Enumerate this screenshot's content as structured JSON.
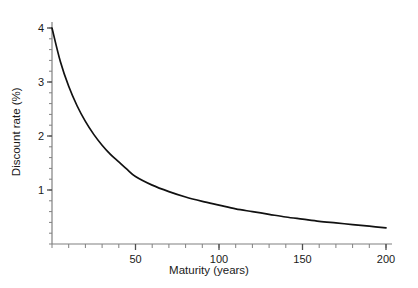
{
  "chart_data": {
    "type": "line",
    "title": "",
    "subtitle": "",
    "xlabel": "Maturity (years)",
    "ylabel": "Discount rate (%)",
    "xlim": [
      0,
      200
    ],
    "ylim": [
      0,
      4
    ],
    "grid": false,
    "legend": null,
    "legend_position": "none",
    "x_major_ticks": [
      50,
      100,
      150,
      200
    ],
    "x_major_tick_labels": [
      "50",
      "100",
      "150",
      "200"
    ],
    "x_minor_tick_step": 10,
    "y_major_ticks": [
      1,
      2,
      3,
      4
    ],
    "y_major_tick_labels": [
      "1",
      "2",
      "3",
      "4"
    ],
    "y_minor_tick_step": 0.2,
    "line_color": "#111111",
    "axis_color": "#808080",
    "series": [
      {
        "name": "Discount rate",
        "x": [
          0,
          5,
          10,
          15,
          20,
          25,
          30,
          35,
          40,
          45,
          50,
          60,
          70,
          80,
          90,
          100,
          110,
          120,
          130,
          140,
          150,
          160,
          170,
          180,
          190,
          200
        ],
        "values": [
          4.0,
          3.38,
          2.92,
          2.56,
          2.27,
          2.03,
          1.83,
          1.66,
          1.52,
          1.38,
          1.25,
          1.09,
          0.97,
          0.87,
          0.79,
          0.72,
          0.65,
          0.6,
          0.55,
          0.5,
          0.46,
          0.42,
          0.39,
          0.36,
          0.33,
          0.3
        ]
      }
    ],
    "annotations": []
  },
  "axis_titles": {
    "x": "Maturity (years)",
    "y": "Discount rate (%)"
  }
}
